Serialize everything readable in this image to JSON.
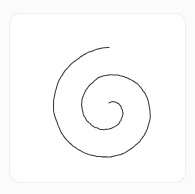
{
  "canvas": {
    "width": 195,
    "height": 194,
    "background_color": "#fbfbfc"
  },
  "card": {
    "label": "spiral-sketch-card",
    "x": 9,
    "y": 13,
    "width": 177,
    "height": 170,
    "corner_radius": 11,
    "background_color": "#ffffff",
    "border_color": "#f0f0f2"
  },
  "drawing": {
    "name": "spiral",
    "description": "Hand-drawn Archimedean spiral, roughly two turns, unwinding clockwise from the centre and terminating near the top.",
    "stroke_color": "#3a3a3c",
    "stroke_width": 1.05,
    "fill": "none",
    "turns": 2,
    "center_x": 99,
    "center_y": 95,
    "inner_radius": 6,
    "outer_radius": 62,
    "start_angle_deg": 90,
    "end_angle_deg": -630,
    "bounds": {
      "left": 33,
      "top": 20,
      "right": 157,
      "bottom": 174
    }
  }
}
